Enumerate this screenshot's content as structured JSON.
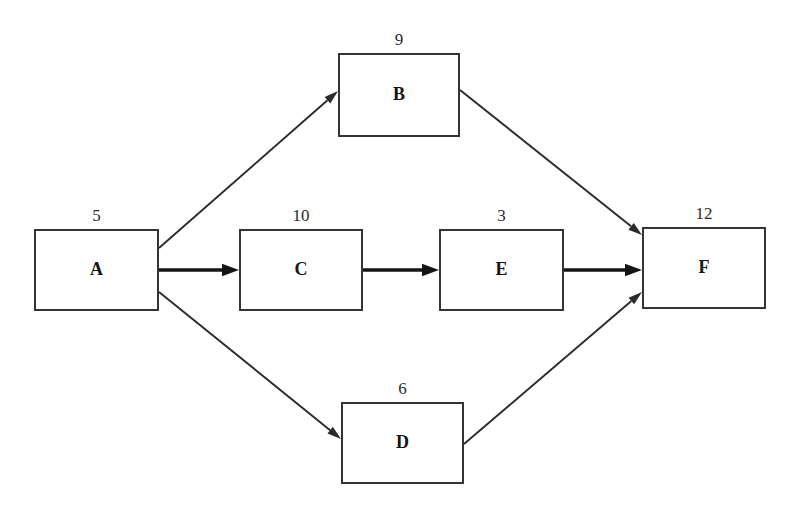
{
  "diagram": {
    "type": "activity-network",
    "background_color": "#ffffff",
    "line_color": "#2b2b2b",
    "text_color": "#151515",
    "nodes": [
      {
        "id": "A",
        "label": "A",
        "duration": "5",
        "x": 35,
        "y": 230,
        "w": 123,
        "h": 80
      },
      {
        "id": "B",
        "label": "B",
        "duration": "9",
        "x": 339,
        "y": 54,
        "w": 120,
        "h": 82
      },
      {
        "id": "C",
        "label": "C",
        "duration": "10",
        "x": 240,
        "y": 230,
        "w": 122,
        "h": 80
      },
      {
        "id": "D",
        "label": "D",
        "duration": "6",
        "x": 342,
        "y": 403,
        "w": 121,
        "h": 80
      },
      {
        "id": "E",
        "label": "E",
        "duration": "3",
        "x": 440,
        "y": 230,
        "w": 123,
        "h": 80
      },
      {
        "id": "F",
        "label": "F",
        "duration": "12",
        "x": 643,
        "y": 228,
        "w": 122,
        "h": 80
      }
    ],
    "edges": [
      {
        "id": "A-B",
        "from": "A",
        "to": "B",
        "style": "thin",
        "x1": 159,
        "y1": 248,
        "x2": 338,
        "y2": 91
      },
      {
        "id": "A-C",
        "from": "A",
        "to": "C",
        "style": "bold",
        "x1": 159,
        "y1": 270,
        "x2": 239,
        "y2": 270
      },
      {
        "id": "A-D",
        "from": "A",
        "to": "D",
        "style": "thin",
        "x1": 159,
        "y1": 292,
        "x2": 341,
        "y2": 439
      },
      {
        "id": "C-E",
        "from": "C",
        "to": "E",
        "style": "bold",
        "x1": 363,
        "y1": 270,
        "x2": 439,
        "y2": 270
      },
      {
        "id": "E-F",
        "from": "E",
        "to": "F",
        "style": "bold",
        "x1": 564,
        "y1": 270,
        "x2": 642,
        "y2": 270
      },
      {
        "id": "B-F",
        "from": "B",
        "to": "F",
        "style": "thin",
        "x1": 460,
        "y1": 90,
        "x2": 642,
        "y2": 235
      },
      {
        "id": "D-F",
        "from": "D",
        "to": "F",
        "style": "thin",
        "x1": 464,
        "y1": 444,
        "x2": 642,
        "y2": 292
      }
    ]
  }
}
